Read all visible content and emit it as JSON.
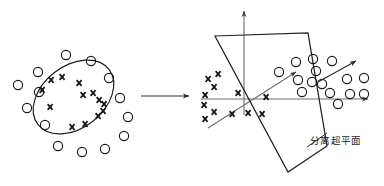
{
  "figure": {
    "background_color": "#ffffff",
    "ink_color": "#1a1a1a",
    "axis_color": "#6f6f6f"
  },
  "labels": {
    "hyperplane_cn": "分离超平面",
    "hyperplane_label_x": 310,
    "hyperplane_label_y": 144
  },
  "transform_arrow": {
    "name": "mapping-arrow",
    "x1": 141,
    "y1": 96,
    "x2": 189,
    "y2": 96,
    "head_size": 5
  },
  "left_panel": {
    "name": "input-space-panel",
    "boundary_ellipse": {
      "cx": 73.5,
      "cy": 97,
      "rx": 45,
      "ry": 31,
      "rotation": -38
    },
    "outside_circles": [
      {
        "cx": 38,
        "cy": 72,
        "r": 4.6
      },
      {
        "cx": 39,
        "cy": 92,
        "r": 4.6
      },
      {
        "cx": 27,
        "cy": 108,
        "r": 4.6
      },
      {
        "cx": 45,
        "cy": 125,
        "r": 4.6
      },
      {
        "cx": 58,
        "cy": 146,
        "r": 4.6
      },
      {
        "cx": 82,
        "cy": 152,
        "r": 4.6
      },
      {
        "cx": 105,
        "cy": 149,
        "r": 4.6
      },
      {
        "cx": 124,
        "cy": 136,
        "r": 4.6
      },
      {
        "cx": 128,
        "cy": 117,
        "r": 4.6
      },
      {
        "cx": 120,
        "cy": 98,
        "r": 4.6
      },
      {
        "cx": 109,
        "cy": 78,
        "r": 4.6
      },
      {
        "cx": 91,
        "cy": 61,
        "r": 4.6
      },
      {
        "cx": 66,
        "cy": 55,
        "r": 4.6
      },
      {
        "cx": 18,
        "cy": 85,
        "r": 4.6
      }
    ],
    "inside_crosses": [
      {
        "cx": 51,
        "cy": 80,
        "s": 5
      },
      {
        "cx": 62,
        "cy": 77,
        "s": 5
      },
      {
        "cx": 42,
        "cy": 90,
        "s": 5
      },
      {
        "cx": 79,
        "cy": 83,
        "s": 5
      },
      {
        "cx": 83,
        "cy": 95,
        "s": 5
      },
      {
        "cx": 93,
        "cy": 93,
        "s": 5
      },
      {
        "cx": 99,
        "cy": 100,
        "s": 5
      },
      {
        "cx": 104,
        "cy": 104,
        "s": 5
      },
      {
        "cx": 50,
        "cy": 107,
        "s": 5
      },
      {
        "cx": 98,
        "cy": 116,
        "s": 5
      },
      {
        "cx": 103,
        "cy": 111,
        "s": 5
      },
      {
        "cx": 72,
        "cy": 127,
        "s": 5
      },
      {
        "cx": 85,
        "cy": 124,
        "s": 5
      }
    ]
  },
  "right_panel": {
    "name": "feature-space-panel",
    "axes": {
      "vertical": {
        "x1": 244,
        "y1": 115,
        "x2": 244,
        "y2": 11
      },
      "horizontal": {
        "x1": 201,
        "y1": 99,
        "x2": 368,
        "y2": 99
      },
      "depth": {
        "x1": 208,
        "y1": 128,
        "x2": 296,
        "y2": 72
      }
    },
    "plane_polygon": [
      {
        "x": 215,
        "y": 36
      },
      {
        "x": 308,
        "y": 33
      },
      {
        "x": 327,
        "y": 146
      },
      {
        "x": 288,
        "y": 172
      }
    ],
    "hyperplane_edge": {
      "x1": 215,
      "y1": 36,
      "x2": 288,
      "y2": 172
    },
    "leader_line": {
      "x1": 307,
      "y1": 147,
      "x2": 327,
      "y2": 133
    },
    "crosses": [
      {
        "cx": 208,
        "cy": 79,
        "s": 5
      },
      {
        "cx": 218,
        "cy": 74,
        "s": 5
      },
      {
        "cx": 214,
        "cy": 87,
        "s": 5
      },
      {
        "cx": 205,
        "cy": 95,
        "s": 5
      },
      {
        "cx": 238,
        "cy": 93,
        "s": 5
      },
      {
        "cx": 204,
        "cy": 105,
        "s": 5
      },
      {
        "cx": 214,
        "cy": 112,
        "s": 5
      },
      {
        "cx": 205,
        "cy": 119,
        "s": 5
      },
      {
        "cx": 232,
        "cy": 114,
        "s": 5
      },
      {
        "cx": 248,
        "cy": 113,
        "s": 5
      },
      {
        "cx": 262,
        "cy": 114,
        "s": 5
      },
      {
        "cx": 266,
        "cy": 97,
        "s": 5
      }
    ],
    "circles": [
      {
        "cx": 296,
        "cy": 62,
        "r": 4.6
      },
      {
        "cx": 313,
        "cy": 59,
        "r": 4.6
      },
      {
        "cx": 332,
        "cy": 61,
        "r": 4.6
      },
      {
        "cx": 279,
        "cy": 72,
        "r": 4.6
      },
      {
        "cx": 316,
        "cy": 71,
        "r": 4.6
      },
      {
        "cx": 298,
        "cy": 80,
        "r": 4.6
      },
      {
        "cx": 312,
        "cy": 82,
        "r": 4.6
      },
      {
        "cx": 322,
        "cy": 84,
        "r": 4.6
      },
      {
        "cx": 302,
        "cy": 92,
        "r": 4.6
      },
      {
        "cx": 330,
        "cy": 93,
        "r": 4.6
      },
      {
        "cx": 347,
        "cy": 79,
        "r": 4.6
      },
      {
        "cx": 364,
        "cy": 78,
        "r": 4.6
      },
      {
        "cx": 350,
        "cy": 94,
        "r": 4.6
      },
      {
        "cx": 364,
        "cy": 94,
        "r": 4.6
      },
      {
        "cx": 338,
        "cy": 104,
        "r": 4.6
      }
    ],
    "normal_arrow": {
      "x1": 318,
      "y1": 82,
      "x2": 356,
      "y2": 61
    }
  }
}
